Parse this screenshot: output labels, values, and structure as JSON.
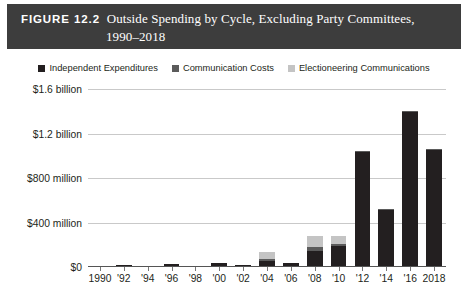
{
  "title": {
    "figure_label": "FIGURE 12.2",
    "caption_line1": "Outside Spending by Cycle, Excluding Party Committees,",
    "caption_line2": "1990–2018",
    "bar_color": "#3d3d3d",
    "text_color": "#ffffff"
  },
  "legend": {
    "position": "top-center",
    "items": [
      {
        "label": "Independent Expenditures",
        "color": "#231f20"
      },
      {
        "label": "Communication Costs",
        "color": "#5b5b5b"
      },
      {
        "label": "Electioneering Communications",
        "color": "#c4c4c4"
      }
    ]
  },
  "chart_data": {
    "type": "bar",
    "stacked": true,
    "title": "Outside Spending by Cycle, Excluding Party Committees, 1990–2018",
    "xlabel": "",
    "ylabel": "",
    "grid": true,
    "ylim": [
      0,
      1600
    ],
    "y_unit": "millions of dollars",
    "ytick_values": [
      0,
      400,
      800,
      1200,
      1600
    ],
    "ytick_labels": [
      "$0",
      "$400 million",
      "$800 million",
      "$1.2 billion",
      "$1.6 billion"
    ],
    "categories": [
      "1990",
      "'92",
      "'94",
      "'96",
      "'98",
      "'00",
      "'02",
      "'04",
      "'06",
      "'08",
      "'10",
      "'12",
      "'14",
      "'16",
      "2018"
    ],
    "series": [
      {
        "name": "Independent Expenditures",
        "color": "#231f20",
        "values": [
          5,
          22,
          8,
          25,
          10,
          35,
          20,
          55,
          35,
          145,
          190,
          1030,
          510,
          1390,
          1050
        ]
      },
      {
        "name": "Communication Costs",
        "color": "#5b5b5b",
        "values": [
          0,
          0,
          0,
          0,
          0,
          0,
          0,
          20,
          0,
          35,
          15,
          12,
          10,
          10,
          8
        ]
      },
      {
        "name": "Electioneering Communications",
        "color": "#c4c4c4",
        "values": [
          0,
          0,
          0,
          0,
          0,
          0,
          0,
          60,
          0,
          95,
          75,
          0,
          0,
          0,
          0
        ]
      }
    ],
    "totals": [
      5,
      22,
      8,
      25,
      10,
      35,
      20,
      135,
      35,
      275,
      280,
      1042,
      520,
      1400,
      1058
    ]
  }
}
